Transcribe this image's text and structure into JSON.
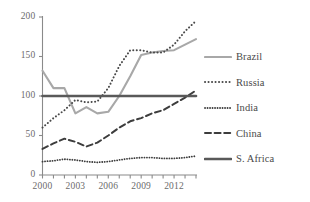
{
  "chart_data": {
    "type": "line",
    "title": "",
    "subtitle": "",
    "xlabel": "",
    "ylabel": "",
    "xlim": [
      2000,
      2014
    ],
    "ylim": [
      0,
      200
    ],
    "grid": false,
    "legend_position": "right",
    "x": [
      2000,
      2001,
      2002,
      2003,
      2004,
      2005,
      2006,
      2007,
      2008,
      2009,
      2010,
      2011,
      2012,
      2013,
      2014
    ],
    "y_ticks": [
      0,
      50,
      100,
      150,
      200
    ],
    "y_tick_labels": [
      "0",
      "50",
      "100",
      "150",
      "200"
    ],
    "x_ticks": [
      2000,
      2001,
      2002,
      2003,
      2004,
      2005,
      2006,
      2007,
      2008,
      2009,
      2010,
      2011,
      2012,
      2013,
      2014
    ],
    "x_tick_labels": [
      "2000",
      "",
      "",
      "2003",
      "",
      "",
      "2006",
      "",
      "",
      "2009",
      "",
      "",
      "2012",
      "",
      ""
    ],
    "x_labelled_ticks": [
      "2000",
      "2003",
      "2006",
      "2009",
      "2012"
    ],
    "series": [
      {
        "name": "Brazil",
        "style": "solid",
        "color": "#a8a8a8",
        "width": 2.1,
        "values": [
          132,
          110,
          110,
          78,
          86,
          78,
          80,
          100,
          125,
          152,
          155,
          157,
          158,
          165,
          172
        ]
      },
      {
        "name": "Russia",
        "style": "dotted-large",
        "color": "#4a4a4a",
        "width": 2.0,
        "values": [
          60,
          72,
          82,
          95,
          92,
          93,
          110,
          138,
          158,
          158,
          155,
          155,
          165,
          182,
          195
        ]
      },
      {
        "name": "India",
        "style": "dotted-fine",
        "color": "#3d3d3d",
        "width": 1.8,
        "values": [
          17,
          18,
          20,
          19,
          17,
          16,
          17,
          19,
          21,
          22,
          22,
          21,
          21,
          22,
          24
        ]
      },
      {
        "name": "China",
        "style": "dashed",
        "color": "#3d3d3d",
        "width": 2.0,
        "values": [
          33,
          40,
          46,
          42,
          36,
          41,
          50,
          60,
          68,
          72,
          78,
          82,
          90,
          98,
          107
        ]
      },
      {
        "name": "S. Africa",
        "style": "solid-thick",
        "color": "#595959",
        "width": 2.6,
        "values": [
          100,
          100,
          100,
          100,
          100,
          100,
          100,
          100,
          100,
          100,
          100,
          100,
          100,
          100,
          100
        ]
      }
    ]
  },
  "legend": {
    "items": [
      {
        "label": "Brazil",
        "swatch": "solid-gray-line-swatch"
      },
      {
        "label": "Russia",
        "swatch": "dotted-large-line-swatch"
      },
      {
        "label": "India",
        "swatch": "dotted-fine-line-swatch"
      },
      {
        "label": "China",
        "swatch": "dashed-line-swatch"
      },
      {
        "label": "S. Africa",
        "swatch": "solid-dark-line-swatch"
      }
    ]
  },
  "axes": {
    "y_labels": [
      "200",
      "150",
      "100",
      "50",
      "0"
    ],
    "x_labels": [
      "2000",
      "2003",
      "2006",
      "2009",
      "2012"
    ]
  },
  "colors": {
    "brazil": "#a8a8a8",
    "russia": "#4a4a4a",
    "india": "#3d3d3d",
    "china": "#3d3d3d",
    "safrica": "#595959",
    "axis": "#8a8a8a",
    "tick_text": "#6b6b6b"
  }
}
